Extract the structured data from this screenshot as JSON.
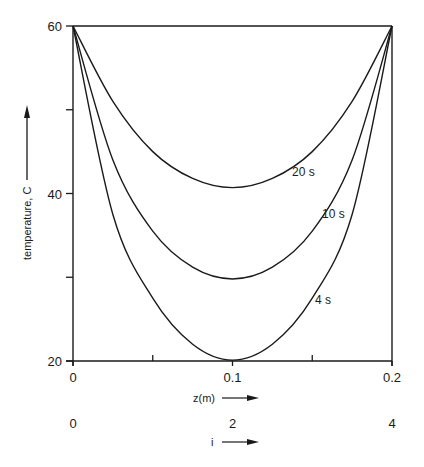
{
  "chart_data": {
    "type": "line",
    "title": "",
    "xlabel": "z(m)",
    "xlabel2": "i",
    "ylabel": "temperature, C",
    "xlim": [
      0,
      0.2
    ],
    "ylim": [
      20,
      60
    ],
    "grid": false,
    "legend": "inline labels on curves",
    "x_ticks": [
      "0",
      "0.1",
      "0.2"
    ],
    "x_minor_ticks": [
      0.05,
      0.15
    ],
    "x2_ticks": [
      "0",
      "2",
      "4"
    ],
    "y_ticks": [
      "20",
      "40",
      "60"
    ],
    "y_minor_ticks": [
      30,
      50
    ],
    "x": [
      0,
      0.025,
      0.05,
      0.075,
      0.1,
      0.125,
      0.15,
      0.175,
      0.2
    ],
    "series": [
      {
        "name": "4 s",
        "label": "4 s",
        "values": [
          60,
          37.5,
          27.5,
          22.0,
          20.1,
          22.0,
          27.5,
          37.5,
          60
        ]
      },
      {
        "name": "10 s",
        "label": "10 s",
        "values": [
          60,
          44.0,
          35.5,
          31.2,
          29.8,
          31.2,
          35.5,
          44.0,
          60
        ]
      },
      {
        "name": "20 s",
        "label": "20 s",
        "values": [
          60,
          51.0,
          45.0,
          41.8,
          40.7,
          41.8,
          45.0,
          51.0,
          60
        ]
      }
    ]
  }
}
